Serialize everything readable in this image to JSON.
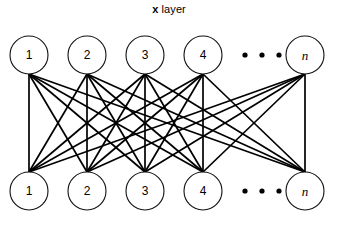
{
  "figure": {
    "title": {
      "variable": "x",
      "word": "layer"
    },
    "background_color": "#ffffff",
    "line_color": "#000000",
    "node_stroke_color": "#111111",
    "node_fill_color": "#ffffff"
  },
  "diagram": {
    "type": "fully-connected-bipartite-network",
    "layers": [
      {
        "name": "top-layer",
        "position": "top",
        "nodes": [
          {
            "label": "1",
            "style": "normal",
            "cx": 29,
            "cy": 55
          },
          {
            "label": "2",
            "style": "normal",
            "cx": 87,
            "cy": 55
          },
          {
            "label": "3",
            "style": "normal",
            "cx": 145,
            "cy": 55
          },
          {
            "label": "4",
            "style": "normal",
            "cx": 203,
            "cy": 55
          },
          {
            "label": "n",
            "style": "italic",
            "cx": 305,
            "cy": 55
          }
        ],
        "ellipsis": {
          "dots": 3,
          "x_positions": [
            245,
            262,
            279
          ],
          "cy": 55
        }
      },
      {
        "name": "bottom-layer",
        "position": "bottom",
        "nodes": [
          {
            "label": "1",
            "style": "normal",
            "cx": 29,
            "cy": 191
          },
          {
            "label": "2",
            "style": "normal",
            "cx": 87,
            "cy": 191
          },
          {
            "label": "3",
            "style": "normal",
            "cx": 145,
            "cy": 191
          },
          {
            "label": "4",
            "style": "normal",
            "cx": 203,
            "cy": 191
          },
          {
            "label": "n",
            "style": "italic",
            "cx": 305,
            "cy": 191
          }
        ],
        "ellipsis": {
          "dots": 3,
          "x_positions": [
            245,
            262,
            279
          ],
          "cy": 191
        }
      }
    ],
    "node_radius": 19,
    "edge_top_y": 74,
    "edge_bottom_y": 172,
    "connections": "each visible top node connects to every visible bottom node"
  }
}
